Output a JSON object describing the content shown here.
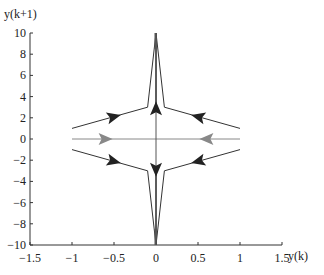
{
  "chart_data": {
    "type": "line",
    "title": "",
    "xlabel": "y(k)",
    "ylabel": "y(k+1)",
    "xlim": [
      -1.5,
      1.5
    ],
    "ylim": [
      -10,
      10
    ],
    "xticks": [
      "-1.5",
      "-1",
      "-0.5",
      "0",
      "0.5",
      "1",
      "1.5"
    ],
    "yticks": [
      "10",
      "8",
      "6",
      "4",
      "2",
      "0",
      "-2",
      "-4",
      "-6",
      "-8",
      "-10"
    ],
    "grid": false,
    "series": [
      {
        "name": "trajectory-upper-left",
        "color": "#333333",
        "x": [
          -1,
          -0.1,
          0,
          0
        ],
        "y": [
          1,
          3,
          10,
          3
        ]
      },
      {
        "name": "trajectory-upper-right",
        "color": "#333333",
        "x": [
          1,
          0.1,
          0,
          0
        ],
        "y": [
          1,
          3,
          10,
          3
        ]
      },
      {
        "name": "trajectory-lower-left",
        "color": "#333333",
        "x": [
          -1,
          -0.1,
          0,
          0
        ],
        "y": [
          -1,
          -3,
          -10,
          -3
        ]
      },
      {
        "name": "trajectory-lower-right",
        "color": "#333333",
        "x": [
          1,
          0.1,
          0,
          0
        ],
        "y": [
          -1,
          -3,
          -10,
          -3
        ]
      },
      {
        "name": "trajectory-zero",
        "color": "#888888",
        "x": [
          -1,
          0,
          1
        ],
        "y": [
          0,
          0,
          0
        ]
      }
    ]
  }
}
